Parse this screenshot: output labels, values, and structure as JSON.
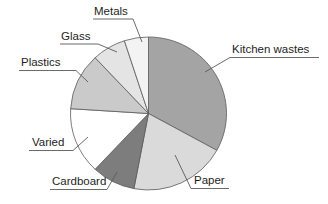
{
  "chart_data": {
    "type": "pie",
    "title": "",
    "legend": "none",
    "labels_style": "external-leader-lines",
    "direction": "clockwise",
    "start_angle_deg": 0,
    "background": "#ffffff",
    "outline_color": "#5a5a5a",
    "slices": [
      {
        "label": "Kitchen wastes",
        "value": 33,
        "color": "#a4a4a4"
      },
      {
        "label": "Paper",
        "value": 20,
        "color": "#dadada"
      },
      {
        "label": "Cardboard",
        "value": 9,
        "color": "#7d7d7d"
      },
      {
        "label": "Varied",
        "value": 14,
        "color": "#ffffff"
      },
      {
        "label": "Plastics",
        "value": 12,
        "color": "#cacaca"
      },
      {
        "label": "Glass",
        "value": 7,
        "color": "#e4e4e4"
      },
      {
        "label": "Metals",
        "value": 5,
        "color": "#f3f3f3"
      }
    ]
  }
}
